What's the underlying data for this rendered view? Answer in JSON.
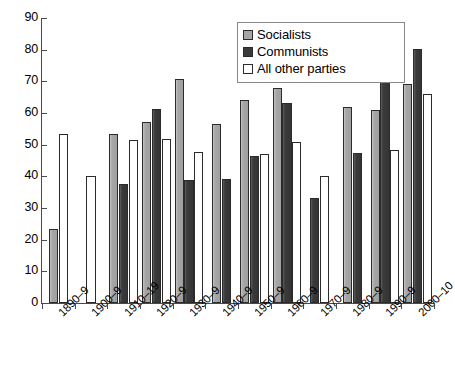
{
  "chart_data": {
    "type": "bar",
    "title": "",
    "subtitle": "",
    "xlabel": "",
    "ylabel": "",
    "ylim": [
      0,
      90
    ],
    "ytick_step": 10,
    "yticks": [
      0,
      10,
      20,
      30,
      40,
      50,
      60,
      70,
      80,
      90
    ],
    "grid": false,
    "legend_position": "top-right",
    "categories": [
      "1890–9",
      "1900–9",
      "1910–19",
      "1920–9",
      "1930–9",
      "1940–9",
      "1950–9",
      "1960–9",
      "1970–9",
      "1980–9",
      "1990–9",
      "2000–10"
    ],
    "series": [
      {
        "name": "Socialists",
        "color": "#a6a6a6",
        "values": [
          23.5,
          null,
          53.5,
          57.2,
          70.6,
          56.5,
          64.0,
          68.0,
          null,
          61.8,
          61.0,
          69.2
        ]
      },
      {
        "name": "Communists",
        "color": "#3a3a3a",
        "values": [
          null,
          null,
          37.5,
          61.3,
          39.0,
          39.2,
          46.4,
          63.3,
          33.2,
          47.5,
          76.8,
          80.2
        ]
      },
      {
        "name": "All other parties",
        "color": "#ffffff",
        "values": [
          53.5,
          40.0,
          51.5,
          51.8,
          47.7,
          null,
          47.0,
          50.8,
          40.2,
          null,
          48.2,
          66.0
        ]
      }
    ]
  },
  "legend": {
    "items": [
      {
        "label": "Socialists",
        "swatch": "socialists"
      },
      {
        "label": "Communists",
        "swatch": "communists"
      },
      {
        "label": "All other parties",
        "swatch": "allother"
      }
    ]
  },
  "axes": {
    "y": {
      "labels": [
        "90",
        "80",
        "70",
        "60",
        "50",
        "40",
        "30",
        "20",
        "10",
        "0"
      ]
    },
    "x": {
      "labels": [
        "1890–9",
        "1900–9",
        "1910–19",
        "1920–9",
        "1930–9",
        "1940–9",
        "1950–9",
        "1960–9",
        "1970–9",
        "1980–9",
        "1990–9",
        "2000–10"
      ]
    }
  }
}
